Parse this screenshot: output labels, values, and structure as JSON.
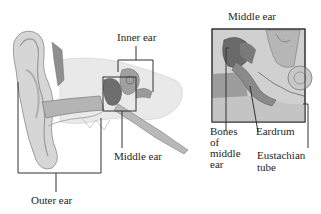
{
  "left_figure": {
    "labels": {
      "inner_ear": "Inner ear",
      "middle_ear": "Middle ear",
      "outer_ear": "Outer ear"
    }
  },
  "right_figure": {
    "title": "Middle ear",
    "labels": {
      "bones_line1": "Bones",
      "bones_line2": "of",
      "bones_line3": "middle",
      "bones_line4": "ear",
      "eardrum": "Eardrum",
      "eustachian_line1": "Eustachian",
      "eustachian_line2": "tube"
    }
  },
  "colors": {
    "background": "#ffffff",
    "line": "#333333",
    "anatomy_light": "#dcdcdc",
    "anatomy_mid": "#a8a8a8",
    "anatomy_dark": "#6e6e6e"
  }
}
